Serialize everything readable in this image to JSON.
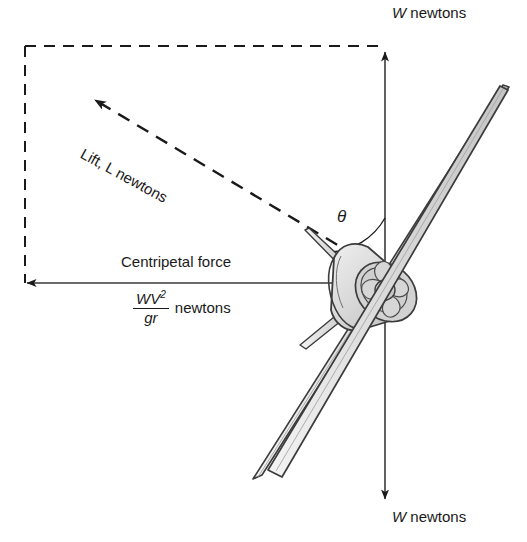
{
  "figure": {
    "background_color": "#ffffff",
    "line_color": "#1a1a1a",
    "aircraft_fill": "#d8d8d8",
    "aircraft_shade": "#bfbfbf"
  },
  "labels": {
    "weight_top": {
      "symbol": "W",
      "units": "newtons"
    },
    "weight_bottom": {
      "symbol": "W",
      "units": "newtons"
    },
    "lift": "Lift, L newtons",
    "centripetal": "Centripetal force",
    "formula": {
      "numerator": "WV",
      "numerator_exponent": "2",
      "denominator": "gr",
      "units": "newtons"
    },
    "angle": "θ"
  },
  "vectors": [
    {
      "name": "weight-up",
      "label": "W newtons",
      "direction": "up",
      "style": "solid",
      "from": [
        385,
        460
      ],
      "to": [
        385,
        50
      ]
    },
    {
      "name": "weight-down",
      "label": "W newtons",
      "direction": "down",
      "style": "solid",
      "from": [
        385,
        300
      ],
      "to": [
        385,
        500
      ]
    },
    {
      "name": "lift",
      "label": "Lift, L newtons",
      "direction": "up-left",
      "style": "dashed",
      "from": [
        355,
        255
      ],
      "to": [
        86,
        92
      ]
    },
    {
      "name": "centripetal-force",
      "label": "Centripetal force",
      "direction": "left",
      "style": "solid",
      "from": [
        355,
        283
      ],
      "to": [
        25,
        283
      ]
    }
  ],
  "construction_lines": [
    {
      "name": "dashed-top-edge",
      "style": "dashed",
      "from": [
        25,
        46
      ],
      "to": [
        385,
        46
      ]
    },
    {
      "name": "dashed-left-edge",
      "style": "dashed",
      "from": [
        25,
        46
      ],
      "to": [
        25,
        283
      ]
    }
  ]
}
